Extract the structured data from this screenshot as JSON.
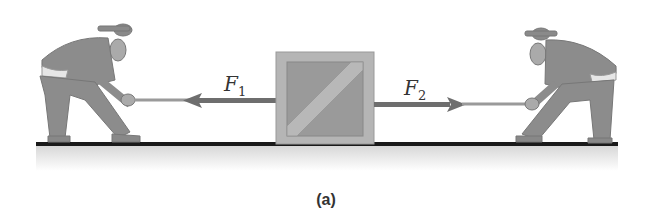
{
  "figure": {
    "caption": "(a)",
    "forces": [
      {
        "symbol": "F",
        "subscript": "1",
        "direction": "left"
      },
      {
        "symbol": "F",
        "subscript": "2",
        "direction": "right"
      }
    ],
    "objects": [
      "person-left",
      "crate",
      "person-right"
    ],
    "colors": {
      "arrow": "#6e6e6e",
      "crate_frame": "#b5b5b5",
      "crate_panel": "#9a9a9a",
      "ground": "#1a1a1a",
      "figure_fill": "#8c8c8c"
    }
  }
}
